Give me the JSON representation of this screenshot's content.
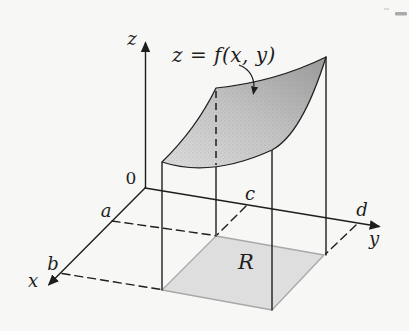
{
  "figure": {
    "equation_label": "z = f(x, y)",
    "origin_label": "0",
    "axes": {
      "x_label": "x",
      "y_label": "y",
      "z_label": "z"
    },
    "ticks": {
      "a_label": "a",
      "b_label": "b",
      "c_label": "c",
      "d_label": "d"
    },
    "region_label": "R",
    "colors": {
      "line": "#1e1e1e",
      "background": "#f7f7f5",
      "surface_dark": "#9e9e9e",
      "surface_mid": "#c2c2c2",
      "surface_light": "#d9d9d9",
      "region_fill": "#dedede",
      "region_border": "#a8a8a8",
      "corner_mark": "#9c9c9c"
    }
  }
}
